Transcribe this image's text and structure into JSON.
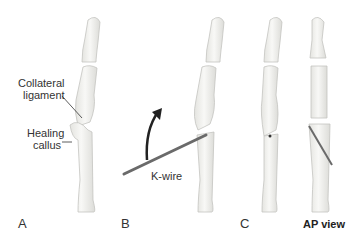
{
  "labels": {
    "collateral_ligament_line1": "Collateral",
    "collateral_ligament_line2": "ligament",
    "healing_callus_line1": "Healing",
    "healing_callus_line2": "callus",
    "k_wire": "K-wire"
  },
  "panels": {
    "a": "A",
    "b": "B",
    "c": "C",
    "ap_view": "AP view"
  },
  "colors": {
    "bone_fill": "#f2f2f0",
    "bone_stroke": "#c8c8c4",
    "wire": "#6a6a6a",
    "arrow": "#222222"
  }
}
